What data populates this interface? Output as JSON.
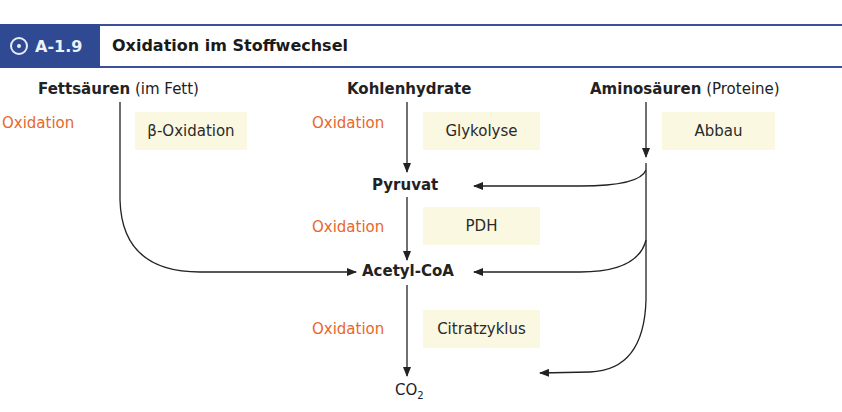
{
  "header": {
    "figure_number": "A-1.9",
    "icon": "target-circle-icon",
    "title": "Oxidation im Stoffwechsel",
    "accent_color": "#2f4a93"
  },
  "sources": {
    "fat": {
      "name": "Fettsäuren",
      "note": "(im Fett)"
    },
    "carbs": {
      "name": "Kohlenhydrate"
    },
    "amino": {
      "name": "Aminosäuren",
      "note": "(Proteine)"
    }
  },
  "oxidation_label": "Oxidation",
  "oxidation_color": "#e8672a",
  "processes": {
    "beta_oxidation": "β-Oxidation",
    "glycolysis": "Glykolyse",
    "breakdown": "Abbau",
    "pdh": "PDH",
    "citric_cycle": "Citratzyklus"
  },
  "intermediates": {
    "pyruvate": "Pyruvat",
    "acetyl_coa": "Acetyl-CoA",
    "co2_base": "CO",
    "co2_sub": "2"
  }
}
